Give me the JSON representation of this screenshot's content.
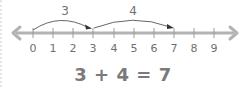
{
  "diagram": {
    "number_line": {
      "ticks": [
        "0",
        "1",
        "2",
        "3",
        "4",
        "5",
        "6",
        "7",
        "8",
        "9"
      ],
      "line_color": "#b3b3b3",
      "tick_color": "#9a9a9a"
    },
    "jumps": [
      {
        "label": "3",
        "from": 0,
        "to": 3
      },
      {
        "label": "4",
        "from": 3,
        "to": 7
      }
    ],
    "equation": {
      "addend1": "3",
      "plus": "+",
      "addend2": "4",
      "equals": "=",
      "sum": "7",
      "text": "3 + 4 = 7"
    },
    "colors": {
      "text": "#6f6f6f",
      "equation": "#7a7a7a",
      "arc": "#555555"
    }
  }
}
